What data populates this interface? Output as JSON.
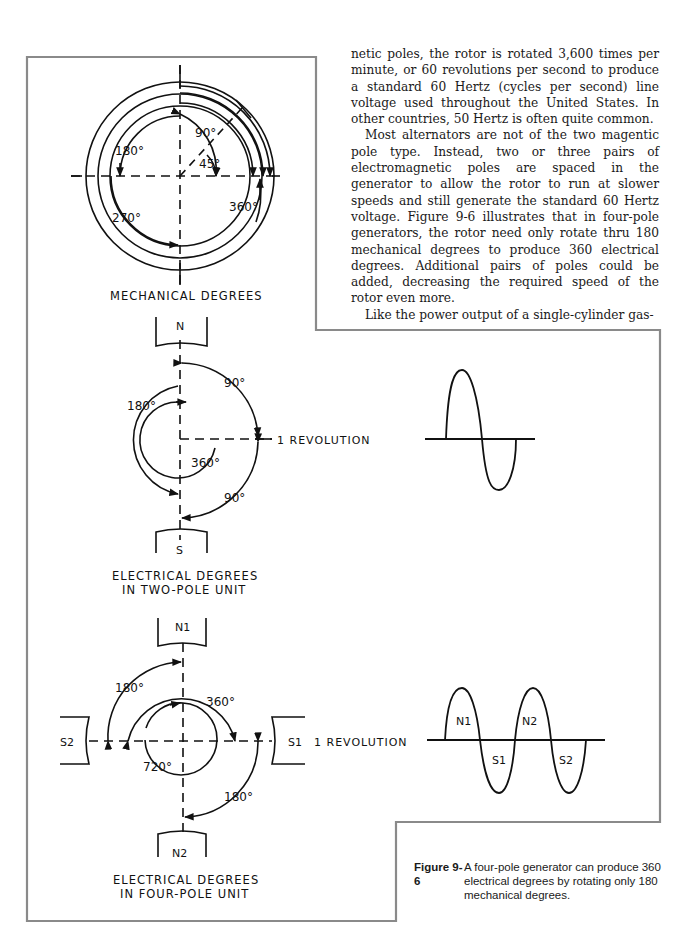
{
  "body_text": {
    "paragraphs": [
      "netic poles, the rotor is rotated 3,600 times per minute, or 60 revolutions per second to produce a standard 60 Hertz (cycles per second) line voltage used throughout the United States. In other countries, 50 Hertz is often quite common.",
      "Most alternators are not of the two magentic pole type. Instead, two or three pairs of electromagnetic poles are spaced in the generator to allow the rotor to run at slower speeds and still generate the standard 60 Hertz voltage. Figure 9-6 illustrates that in four-pole generators, the rotor need only rotate thru 180 mechanical degrees to produce 360 electrical degrees. Additional pairs of poles could be added, decreasing the required speed of the rotor even more.",
      "Like the power output of a single-cylinder gas-"
    ]
  },
  "figure": {
    "mechanical": {
      "title": "MECHANICAL DEGREES",
      "labels": [
        "90°",
        "45°",
        "180°",
        "270°",
        "360°"
      ]
    },
    "two_pole": {
      "title_line1": "ELECTRICAL DEGREES",
      "title_line2": "IN TWO-POLE UNIT",
      "pole_top": "N",
      "pole_bottom": "S",
      "labels": [
        "90°",
        "180°",
        "360°",
        "90°"
      ],
      "revolution_label": "1 REVOLUTION"
    },
    "four_pole": {
      "title_line1": "ELECTRICAL DEGREES",
      "title_line2": "IN FOUR-POLE UNIT",
      "pole_top": "N1",
      "pole_bottom": "N2",
      "pole_left": "S2",
      "pole_right": "S1",
      "labels": [
        "180°",
        "360°",
        "720°",
        "180°"
      ],
      "revolution_label": "1 REVOLUTION"
    },
    "waveform_two_pole": {
      "cycles": 1
    },
    "waveform_four_pole": {
      "cycles": 2,
      "lobe_labels": [
        "N1",
        "S1",
        "N2",
        "S2"
      ]
    },
    "caption": {
      "label": "Figure 9-6",
      "text": "A four-pole generator can produce 360 electrical degrees by rotating only 180 mechanical degrees."
    }
  }
}
